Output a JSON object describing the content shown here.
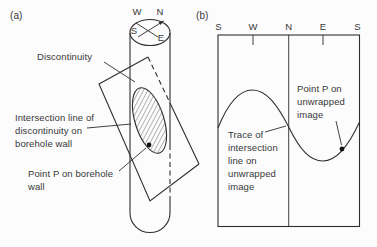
{
  "figure": {
    "panel_a": {
      "label": "(a)",
      "compass": {
        "west": "W",
        "north": "N",
        "south": "S",
        "east": "E"
      },
      "annotations": {
        "discontinuity": "Discontinuity",
        "intersection": [
          "Intersection line of",
          "discontinuity on",
          "borehole wall"
        ],
        "point_p": [
          "Point P on borehole",
          "wall"
        ]
      }
    },
    "panel_b": {
      "label": "(b)",
      "axis": [
        "S",
        "W",
        "N",
        "E",
        "S"
      ],
      "annotations": {
        "point_p": [
          "Point P on",
          "unwrapped",
          "image"
        ],
        "trace": [
          "Trace of",
          "intersection",
          "line on",
          "unwrapped",
          "image"
        ]
      }
    },
    "colors": {
      "line": "#2e2e2e",
      "background": "#fcfcfc"
    }
  }
}
